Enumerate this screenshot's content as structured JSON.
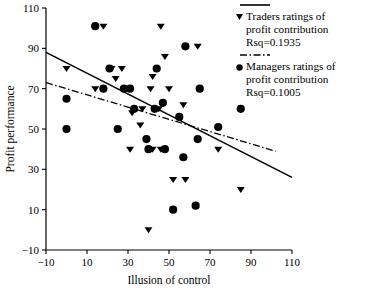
{
  "chart_data": {
    "type": "scatter",
    "title": "",
    "xlabel": "Illusion of control",
    "ylabel": "Profit performance",
    "xlim": [
      -10,
      110
    ],
    "ylim": [
      -10,
      110
    ],
    "xticks": [
      "-10",
      "10",
      "30",
      "50",
      "70",
      "90",
      "110"
    ],
    "yticks": [
      "110",
      "90",
      "70",
      "50",
      "30",
      "10",
      "-10"
    ],
    "xtick_values": [
      -10,
      10,
      30,
      50,
      70,
      90,
      110
    ],
    "ytick_values": [
      110,
      90,
      70,
      50,
      30,
      10,
      -10
    ],
    "grid": false,
    "legend_position": "upper-right-outside",
    "series": [
      {
        "name": "Traders ratings of profit contribution",
        "marker": "triangle-down",
        "rsq_label": "Rsq=0.1935",
        "rsq": 0.1935,
        "fit_line": {
          "style": "solid",
          "x_start": -10,
          "y_start": 88,
          "x_end": 110,
          "y_end": 26
        },
        "points": [
          [
            18,
            101
          ],
          [
            46,
            101
          ],
          [
            64,
            91
          ],
          [
            48,
            86
          ],
          [
            0,
            80
          ],
          [
            22,
            80
          ],
          [
            27,
            80
          ],
          [
            42,
            76
          ],
          [
            24,
            75
          ],
          [
            14,
            70
          ],
          [
            41,
            70
          ],
          [
            50,
            70
          ],
          [
            57,
            62
          ],
          [
            37,
            60
          ],
          [
            45,
            60
          ],
          [
            32,
            58
          ],
          [
            36,
            52
          ],
          [
            31,
            40
          ],
          [
            42,
            40
          ],
          [
            46,
            40
          ],
          [
            52,
            25
          ],
          [
            58,
            25
          ],
          [
            74,
            40
          ],
          [
            85,
            20
          ],
          [
            40,
            0
          ]
        ]
      },
      {
        "name": "Managers ratings of profit contribution",
        "marker": "circle",
        "rsq_label": "Rsq=0.1005",
        "rsq": 0.1005,
        "fit_line": {
          "style": "dash-dot",
          "x_start": -10,
          "y_start": 73,
          "x_end": 102,
          "y_end": 39
        },
        "points": [
          [
            14,
            101
          ],
          [
            58,
            91
          ],
          [
            21,
            80
          ],
          [
            44,
            80
          ],
          [
            18,
            70
          ],
          [
            28,
            70
          ],
          [
            31,
            70
          ],
          [
            65,
            70
          ],
          [
            0,
            65
          ],
          [
            47,
            63
          ],
          [
            33,
            60
          ],
          [
            43,
            60
          ],
          [
            85,
            60
          ],
          [
            55,
            56
          ],
          [
            0,
            50
          ],
          [
            25,
            50
          ],
          [
            74,
            51
          ],
          [
            39,
            45
          ],
          [
            64,
            45
          ],
          [
            57,
            36
          ],
          [
            40,
            40
          ],
          [
            48,
            40
          ],
          [
            52,
            10
          ],
          [
            63,
            12
          ]
        ]
      }
    ]
  },
  "legend": {
    "entries": [
      {
        "line_style": "solid",
        "marker": "triangle-down",
        "line1": "Traders ratings of",
        "line2": "profit contribution",
        "line3": "Rsq=0.1935"
      },
      {
        "line_style": "dash-dot",
        "marker": "circle",
        "line1": "Managers ratings of",
        "line2": "profit contribution",
        "line3": "Rsq=0.1005"
      }
    ]
  },
  "colors": {
    "ink": "#000000",
    "background": "#ffffff"
  }
}
